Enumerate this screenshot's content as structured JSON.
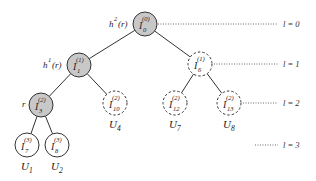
{
  "diagram": {
    "type": "binary-tree",
    "colors": {
      "filled_node": "#c8c8c8",
      "empty_node": "#ffffff",
      "stroke": "#333333"
    },
    "nodes": [
      {
        "id": "n0",
        "base": "I",
        "sup": "(0)",
        "sub": "0",
        "x": 145,
        "y": 24,
        "style": "filled",
        "side_label": "h²(r)",
        "side_label_main": "h",
        "side_label_sup": "2",
        "side_label_tail": "(r)",
        "leaf_label": null
      },
      {
        "id": "n1",
        "base": "I",
        "sup": "(1)",
        "sub": "1",
        "x": 79,
        "y": 65,
        "style": "filled",
        "side_label": "h¹(r)",
        "side_label_main": "h",
        "side_label_sup": "1",
        "side_label_tail": "(r)",
        "leaf_label": null
      },
      {
        "id": "n6",
        "base": "I",
        "sup": "(1)",
        "sub": "6",
        "x": 200,
        "y": 64,
        "style": "dashed",
        "side_label": null,
        "leaf_label": null
      },
      {
        "id": "n3",
        "base": "I",
        "sup": "(2)",
        "sub": "3",
        "x": 41,
        "y": 105,
        "style": "filled",
        "side_label": "r",
        "leaf_label": null
      },
      {
        "id": "n10",
        "base": "I",
        "sup": "(2)",
        "sub": "10",
        "x": 115,
        "y": 103,
        "style": "dashed",
        "side_label": null,
        "leaf_label": "U",
        "leaf_sub": "4"
      },
      {
        "id": "n12",
        "base": "I",
        "sup": "(2)",
        "sub": "12",
        "x": 175,
        "y": 103,
        "style": "dashed",
        "side_label": null,
        "leaf_label": "U",
        "leaf_sub": "7"
      },
      {
        "id": "n13",
        "base": "I",
        "sup": "(2)",
        "sub": "13",
        "x": 229,
        "y": 103,
        "style": "dashed",
        "side_label": null,
        "leaf_label": "U",
        "leaf_sub": "8"
      },
      {
        "id": "n7",
        "base": "I",
        "sup": "(3)",
        "sub": "7",
        "x": 27,
        "y": 145,
        "style": "solid",
        "side_label": null,
        "leaf_label": "U",
        "leaf_sub": "1"
      },
      {
        "id": "n8",
        "base": "I",
        "sup": "(3)",
        "sub": "8",
        "x": 57,
        "y": 145,
        "style": "solid",
        "side_label": null,
        "leaf_label": "U",
        "leaf_sub": "2"
      }
    ],
    "edges": [
      {
        "from": "n0",
        "to": "n1"
      },
      {
        "from": "n0",
        "to": "n6"
      },
      {
        "from": "n1",
        "to": "n3"
      },
      {
        "from": "n1",
        "to": "n10"
      },
      {
        "from": "n6",
        "to": "n12"
      },
      {
        "from": "n6",
        "to": "n13"
      },
      {
        "from": "n3",
        "to": "n7"
      },
      {
        "from": "n3",
        "to": "n8"
      }
    ],
    "levels": [
      {
        "label": "l = 0",
        "y": 24
      },
      {
        "label": "l = 1",
        "y": 64
      },
      {
        "label": "l = 2",
        "y": 103
      },
      {
        "label": "l = 3",
        "y": 145
      }
    ]
  }
}
